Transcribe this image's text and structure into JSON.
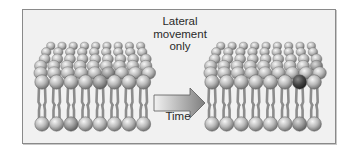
{
  "figure": {
    "labels": {
      "lateral_line1": "Lateral",
      "lateral_line2": "movement",
      "lateral_line3": "only",
      "time": "Time"
    },
    "colors": {
      "frame_bg": "#f1f1f1",
      "frame_border": "#8a8a8a",
      "head_light": "#e2e2e2",
      "head_mid": "#b4b4b4",
      "head_dark": "#6a6a6a",
      "head_marked": "#3c3c3c",
      "tail": "#8c8c8c",
      "arrow_light": "#eeeeee",
      "arrow_dark": "#8a8a8a"
    },
    "bilayers": [
      {
        "name": "before",
        "x0": 42,
        "spacing": 14.5,
        "count": 8,
        "front_y": 82,
        "bottom_y": 124,
        "marked_front_index": 4,
        "marked_top": {
          "row": 4,
          "col": 5
        }
      },
      {
        "name": "after",
        "x0": 212,
        "spacing": 14.6,
        "count": 8,
        "front_y": 82,
        "bottom_y": 124,
        "marked_front_index": 6,
        "marked_top": {
          "row": 3,
          "col": 8
        }
      }
    ],
    "arrow": {
      "x": 152,
      "y": 93,
      "width": 52,
      "height": 20,
      "direction": "right"
    }
  }
}
